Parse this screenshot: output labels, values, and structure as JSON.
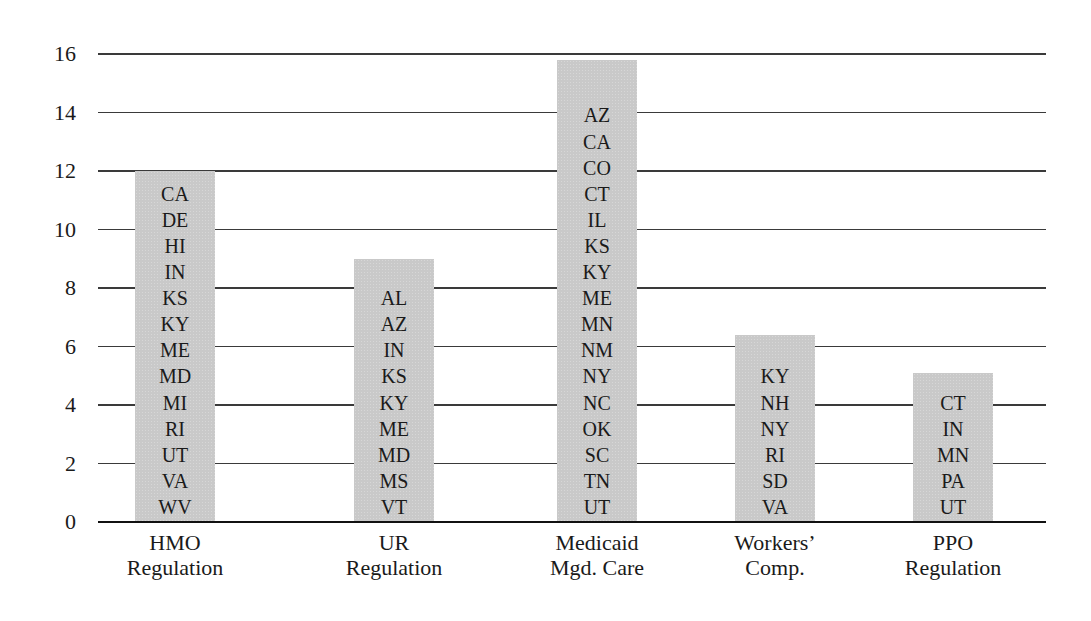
{
  "chart_data": {
    "type": "bar",
    "title": "",
    "xlabel": "",
    "ylabel": "",
    "ylim": [
      0,
      16
    ],
    "yticks": [
      0,
      2,
      4,
      6,
      8,
      10,
      12,
      14,
      16
    ],
    "grid": true,
    "legend": null,
    "categories": [
      "HMO Regulation",
      "UR Regulation",
      "Medicaid Mgd. Care",
      "Workers' Comp.",
      "PPO Regulation"
    ],
    "category_labels": [
      [
        "HMO",
        "Regulation"
      ],
      [
        "UR",
        "Regulation"
      ],
      [
        "Medicaid",
        "Mgd. Care"
      ],
      [
        "Workers’",
        "Comp."
      ],
      [
        "PPO",
        "Regulation"
      ]
    ],
    "values": [
      12,
      9,
      15.8,
      6.4,
      5.1
    ],
    "bar_color": "#c9c9c9",
    "annotations": [
      [
        "CA",
        "DE",
        "HI",
        "IN",
        "KS",
        "KY",
        "ME",
        "MD",
        "MI",
        "RI",
        "UT",
        "VA",
        "WV"
      ],
      [
        "AL",
        "AZ",
        "IN",
        "KS",
        "KY",
        "ME",
        "MD",
        "MS",
        "VT"
      ],
      [
        "AZ",
        "CA",
        "CO",
        "CT",
        "IL",
        "KS",
        "KY",
        "ME",
        "MN",
        "NM",
        "NY",
        "NC",
        "OK",
        "SC",
        "TN",
        "UT"
      ],
      [
        "KY",
        "NH",
        "NY",
        "RI",
        "SD",
        "VA"
      ],
      [
        "CT",
        "IN",
        "MN",
        "PA",
        "UT"
      ]
    ]
  }
}
